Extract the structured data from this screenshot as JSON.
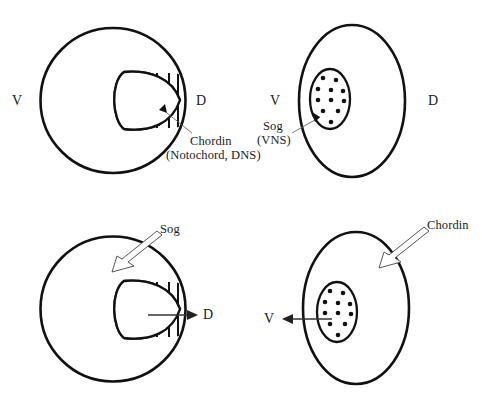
{
  "figure": {
    "background_color": "#ffffff",
    "line_color": "#111111"
  },
  "panels": [
    {
      "id": "top-left",
      "shape": "circle",
      "organism_region": "vertebrate",
      "axis_labels": {
        "ventral": "V",
        "dorsal": "D"
      },
      "inner_region": {
        "style": "hatched",
        "hatch_count": 5
      },
      "callout": {
        "line1": "Chordin",
        "line2": "(Notochord, DNS)",
        "arrow_style": "thin-leader-with-small-head"
      }
    },
    {
      "id": "top-right",
      "shape": "ellipse",
      "organism_region": "invertebrate",
      "axis_labels": {
        "ventral": "V",
        "dorsal": "D"
      },
      "inner_region": {
        "style": "dotted",
        "dot_count": 11
      },
      "callout": {
        "line1": "Sog",
        "line2": "(VNS)",
        "arrow_style": "thin-leader-with-small-head"
      }
    },
    {
      "id": "bottom-left",
      "shape": "circle",
      "organism_region": "vertebrate",
      "axis_labels": {
        "dorsal": "D"
      },
      "inner_region": {
        "style": "hatched",
        "hatch_count": 5
      },
      "callout": {
        "line1": "Sog",
        "arrow_style": "hollow-double-line"
      },
      "flow_arrow": {
        "direction": "right",
        "target_label": "D"
      }
    },
    {
      "id": "bottom-right",
      "shape": "ellipse",
      "organism_region": "invertebrate",
      "axis_labels": {
        "ventral": "V"
      },
      "inner_region": {
        "style": "dotted",
        "dot_count": 11
      },
      "callout": {
        "line1": "Chordin",
        "arrow_style": "hollow-double-line"
      },
      "flow_arrow": {
        "direction": "left",
        "target_label": "V"
      }
    }
  ],
  "labels": {
    "tl_ventral": "V",
    "tl_dorsal": "D",
    "tl_callout_line1": "Chordin",
    "tl_callout_line2": "(Notochord, DNS)",
    "tr_ventral": "V",
    "tr_dorsal": "D",
    "tr_callout_line1": "Sog",
    "tr_callout_line2": "(VNS)",
    "bl_callout": "Sog",
    "bl_dorsal": "D",
    "br_callout": "Chordin",
    "br_ventral": "V"
  }
}
